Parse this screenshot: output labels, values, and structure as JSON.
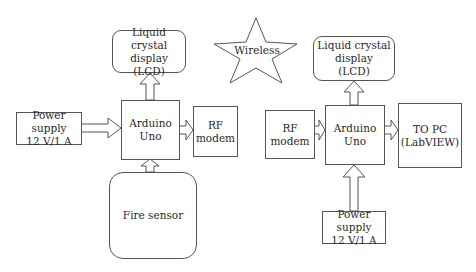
{
  "diagram": {
    "transmitter": {
      "lcd": "Liquid crystal\ndisplay\n(LCD)",
      "power_supply": "Power supply\n12 V/1 A",
      "controller": "Arduino\nUno",
      "rf_modem": "RF\nmodem",
      "sensor": "Fire sensor"
    },
    "link": {
      "label": "Wireless"
    },
    "receiver": {
      "lcd": "Liquid crystal\ndisplay\n(LCD)",
      "rf_modem": "RF\nmodem",
      "controller": "Arduino\nUno",
      "output": "TO PC\n(LabVIEW)",
      "power_supply": "Power supply\n12 V/1 A"
    }
  },
  "colors": {
    "line": "#555555",
    "background": "#ffffff",
    "text": "#2a2a2a"
  }
}
